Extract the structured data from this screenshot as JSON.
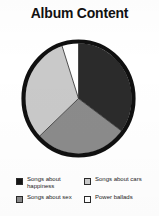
{
  "chart_data": {
    "type": "pie",
    "title": "Album Content",
    "xlabel": "",
    "ylabel": "",
    "legend_position": "bottom",
    "grid": false,
    "start_angle_deg": 0,
    "direction": "clockwise",
    "categories": [
      "Songs about happiness",
      "Songs about sex",
      "Songs about cars",
      "Power ballads"
    ],
    "values": [
      35,
      28,
      32,
      5
    ],
    "colors": [
      "#2b2b2b",
      "#8b8b8b",
      "#c9c9c9",
      "#ffffff"
    ],
    "slices": [
      {
        "label": "Songs about happiness",
        "value": 35,
        "start_deg": 0,
        "end_deg": 126,
        "color": "#2b2b2b"
      },
      {
        "label": "Songs about sex",
        "value": 28,
        "start_deg": 126,
        "end_deg": 227,
        "color": "#8b8b8b"
      },
      {
        "label": "Songs about cars",
        "value": 32,
        "start_deg": 227,
        "end_deg": 342,
        "color": "#c9c9c9"
      },
      {
        "label": "Power ballads",
        "value": 5,
        "start_deg": 342,
        "end_deg": 360,
        "color": "#ffffff"
      }
    ]
  },
  "title": {
    "text": "Album Content"
  },
  "legend": {
    "left_column": [
      {
        "label": "Songs about happiness",
        "color": "#151515"
      },
      {
        "label": "Songs about sex",
        "color": "#8b8b8b"
      }
    ],
    "right_column": [
      {
        "label": "Songs about cars",
        "color": "#c9c9c9"
      },
      {
        "label": "Power ballads",
        "color": "#ffffff"
      }
    ]
  }
}
